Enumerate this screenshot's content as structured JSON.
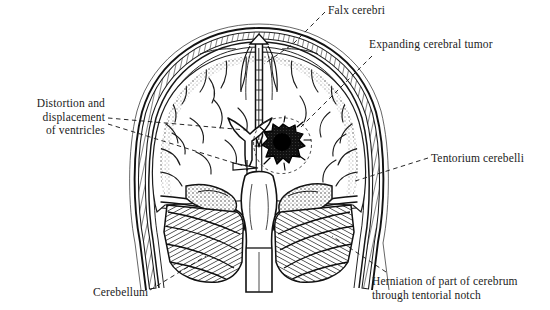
{
  "figure": {
    "view": "coronal section",
    "background_color": "#ffffff",
    "ink_color": "#1a1a1a",
    "style": "black and white anatomical line engraving"
  },
  "labels": {
    "falx": "Falx cerebri",
    "tumor": "Expanding cerebral tumor",
    "ventricles": "Distortion and\ndisplacement\nof ventricles",
    "tentorium": "Tentorium cerebelli",
    "cerebellum": "Cerebellum",
    "herniation": "Herniation of part of cerebrum\nthrough tentorial notch"
  },
  "structures": [
    {
      "name": "skull-vault",
      "description": "Thick multi-layered cranial vault with diploe hatching"
    },
    {
      "name": "falx-cerebri",
      "description": "Midline dural fold descending between the cerebral hemispheres"
    },
    {
      "name": "cerebral-hemispheres",
      "description": "Left and right cerebral hemispheres with gyri and sulci"
    },
    {
      "name": "lateral-ventricles",
      "description": "Y-shaped distorted and displaced lateral ventricles"
    },
    {
      "name": "cerebral-tumor",
      "description": "Dark irregular mass in the right hemisphere"
    },
    {
      "name": "tentorium-cerebelli",
      "description": "Dural shelf between cerebrum and cerebellum"
    },
    {
      "name": "cerebellum",
      "description": "Finely hatched cerebellar folia below the tentorium"
    },
    {
      "name": "brainstem",
      "description": "Midline brainstem descending through the tentorial notch"
    },
    {
      "name": "herniation",
      "description": "Medial temporal lobe pushed through the tentorial notch"
    }
  ],
  "leader_lines": [
    {
      "from": "falx-label",
      "to": "falx-cerebri",
      "style": "dashed"
    },
    {
      "from": "tumor-label",
      "to": "cerebral-tumor",
      "style": "dashed"
    },
    {
      "from": "ventricles-label",
      "to": "lateral-ventricles",
      "style": "dashed",
      "count": 2
    },
    {
      "from": "tentorium-label",
      "to": "tentorium-cerebelli",
      "style": "dashed"
    },
    {
      "from": "cerebellum-label",
      "to": "cerebellum",
      "style": "dashed"
    },
    {
      "from": "herniation-label",
      "to": "herniation",
      "style": "dashed"
    }
  ]
}
